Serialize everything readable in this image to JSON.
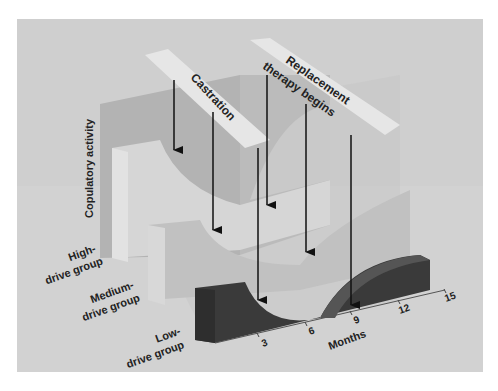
{
  "diagram": {
    "type": "3d-surface-illustration",
    "axis_labels": {
      "vertical": "Copulatory activity",
      "horizontal": "Months"
    },
    "month_ticks": [
      "3",
      "6",
      "9",
      "12",
      "15"
    ],
    "groups": [
      {
        "line1": "High-",
        "line2": "drive group"
      },
      {
        "line1": "Medium-",
        "line2": "drive group"
      },
      {
        "line1": "Low-",
        "line2": "drive group"
      }
    ],
    "banners": {
      "castration": "Castration",
      "replacement_line1": "Replacement",
      "replacement_line2": "therapy begins"
    },
    "colors": {
      "background": "#cfcfcf",
      "back_wall": "#b5b5b5",
      "high_group": "#d9d9d9",
      "medium_group": "#c4c4c4",
      "low_group": "#3d3d3d",
      "banner": "#e6e6e6",
      "arrow": "#111111"
    }
  }
}
